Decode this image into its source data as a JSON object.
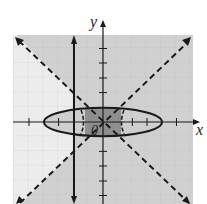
{
  "graph": {
    "x_label": "x",
    "y_label": "y",
    "origin_label": "0",
    "x_range": [
      -6,
      6
    ],
    "y_range": [
      -6,
      6
    ],
    "curves": [
      {
        "name": "ellipse",
        "equation": "x^2/16 + y^2 = 1",
        "style": "solid"
      },
      {
        "name": "vertical-line",
        "equation": "x = -2",
        "style": "solid",
        "arrows": true
      },
      {
        "name": "line-positive",
        "equation": "y = x",
        "style": "dashed",
        "arrows": true
      },
      {
        "name": "line-negative",
        "equation": "y = -x",
        "style": "dashed",
        "arrows": true
      }
    ],
    "shading": {
      "regions": "|y| > |x| (top/bottom wedges) shaded gray; left/right wedges shaded gray to x=-2 inside grid; intersection inside ellipse darker"
    },
    "colors": {
      "light_shade": "#d4d4d4",
      "dark_shade": "#8e8e8e",
      "grid": "#b8b8b8",
      "stroke": "#1a1a1a"
    }
  }
}
